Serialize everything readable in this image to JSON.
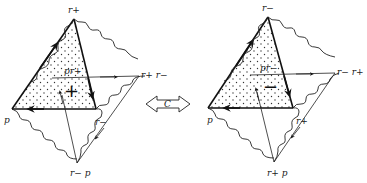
{
  "figure": {
    "type": "diagram",
    "colors": {
      "ink": "#111111",
      "background": "#ffffff"
    }
  },
  "left_diagram": {
    "label_top": "r+",
    "label_right": "r+ r−",
    "label_left": "p",
    "label_bottom": "r− p",
    "label_face": "pr+",
    "label_edge": "r−",
    "face_sign": "+"
  },
  "operator": {
    "label": "C",
    "shape": "double-headed-arrow"
  },
  "right_diagram": {
    "label_top": "r−",
    "label_right": "r− r+",
    "label_left": "p",
    "label_bottom": "r+ p",
    "label_face": "pr−",
    "label_edge": "r+",
    "face_sign": "−"
  }
}
